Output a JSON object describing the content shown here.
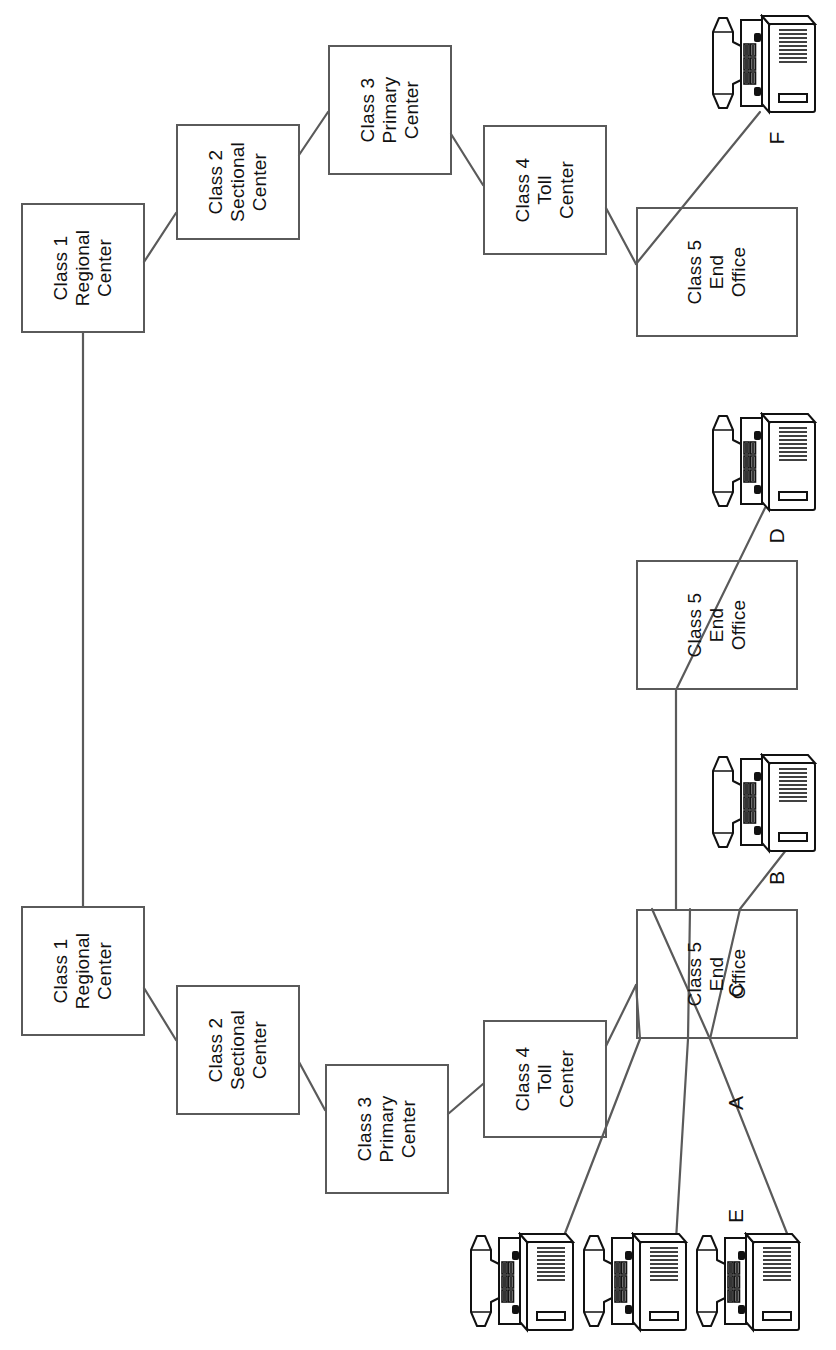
{
  "diagram": {
    "orientation_degrees": -90,
    "nodes": [
      {
        "id": "rc-top",
        "label": "Class 1\nRegional Center",
        "line1": "Class 1",
        "line2": "Regional",
        "line3": "Center",
        "x": 21,
        "y": 203,
        "w": 124,
        "h": 130
      },
      {
        "id": "sc-top",
        "label": "Class 2\nSectional Center",
        "line1": "Class 2",
        "line2": "Sectional",
        "line3": "Center",
        "x": 176,
        "y": 124,
        "w": 124,
        "h": 116
      },
      {
        "id": "pc-top",
        "label": "Class 3\nPrimary Center",
        "line1": "Class 3",
        "line2": "Primary",
        "line3": "Center",
        "x": 328,
        "y": 45,
        "w": 124,
        "h": 130
      },
      {
        "id": "tc-top",
        "label": "Class 4\nToll Center",
        "line1": "Class 4",
        "line2": "Toll",
        "line3": "Center",
        "x": 483,
        "y": 125,
        "w": 124,
        "h": 130
      },
      {
        "id": "eo-top",
        "label": "Class 5\nEnd Office",
        "line1": "Class 5",
        "line2": "End",
        "line3": "Office",
        "x": 636,
        "y": 207,
        "w": 162,
        "h": 130
      },
      {
        "id": "eo-mid",
        "label": "Class 5\nEnd Office",
        "line1": "Class 5",
        "line2": "End",
        "line3": "Office",
        "x": 636,
        "y": 560,
        "w": 162,
        "h": 130
      },
      {
        "id": "eo-bot",
        "label": "Class 5\nEnd Office",
        "line1": "Class 5",
        "line2": "End",
        "line3": "Office",
        "x": 636,
        "y": 909,
        "w": 162,
        "h": 130
      },
      {
        "id": "rc-bot",
        "label": "Class 1\nRegional Center",
        "line1": "Class 1",
        "line2": "Regional",
        "line3": "Center",
        "x": 21,
        "y": 906,
        "w": 124,
        "h": 130
      },
      {
        "id": "sc-bot",
        "label": "Class 2\nSectional Center",
        "line1": "Class 2",
        "line2": "Sectional",
        "line3": "Center",
        "x": 176,
        "y": 985,
        "w": 124,
        "h": 130
      },
      {
        "id": "pc-bot",
        "label": "Class 3\nPrimary Center",
        "line1": "Class 3",
        "line2": "Primary",
        "line3": "Center",
        "x": 325,
        "y": 1064,
        "w": 124,
        "h": 130
      },
      {
        "id": "tc-bot",
        "label": "Class 4\nToll Center",
        "line1": "Class 4",
        "line2": "Toll",
        "line3": "Center",
        "x": 483,
        "y": 1020,
        "w": 124,
        "h": 118
      }
    ],
    "phones": [
      {
        "id": "phone-f",
        "label": "F",
        "x": 712,
        "y": 14,
        "label_x": 770,
        "label_y": 130
      },
      {
        "id": "phone-d",
        "label": "D",
        "x": 712,
        "y": 412,
        "label_x": 770,
        "label_y": 528
      },
      {
        "id": "phone-b",
        "label": "B",
        "x": 712,
        "y": 753,
        "label_x": 770,
        "label_y": 869
      },
      {
        "id": "phone-e",
        "label": "E",
        "x": 470,
        "y": 1232,
        "label_x": 728,
        "label_y": 1210
      },
      {
        "id": "phone-a",
        "label": "A",
        "x": 583,
        "y": 1232,
        "label_x": 728,
        "label_y": 1210
      },
      {
        "id": "phone-c",
        "label": "C",
        "x": 696,
        "y": 1232,
        "label_x": 728,
        "label_y": 1210
      }
    ],
    "phone_labels": [
      {
        "id": "label-f",
        "text": "F",
        "x": 762,
        "y": 126
      },
      {
        "id": "label-d",
        "text": "D",
        "x": 762,
        "y": 524
      },
      {
        "id": "label-b",
        "text": "B",
        "x": 762,
        "y": 866
      },
      {
        "id": "label-e",
        "text": "E",
        "x": 721,
        "y": 1204
      },
      {
        "id": "label-a",
        "text": "A",
        "x": 721,
        "y": 1091
      },
      {
        "id": "label-c",
        "text": "C",
        "x": 721,
        "y": 978
      }
    ],
    "edges": [
      {
        "id": "edge-rc-top-rc-bot",
        "from": "rc-top",
        "to": "rc-bot",
        "points": "83,333 83,906"
      },
      {
        "id": "edge-rc-top-sc-top",
        "from": "rc-top",
        "to": "sc-top",
        "points": "144,262 176,213"
      },
      {
        "id": "edge-sc-top-pc-top",
        "from": "sc-top",
        "to": "pc-top",
        "points": "299,155 328,112"
      },
      {
        "id": "edge-pc-top-tc-top",
        "from": "pc-top",
        "to": "tc-top",
        "points": "451,134 483,185"
      },
      {
        "id": "edge-tc-top-eo-top",
        "from": "tc-top",
        "to": "eo-top",
        "points": "606,208 636,264"
      },
      {
        "id": "edge-eo-top-phone-f",
        "from": "eo-top",
        "to": "phone-f",
        "points": "636,264 760,112"
      },
      {
        "id": "edge-rc-bot-sc-bot",
        "from": "rc-bot",
        "to": "sc-bot",
        "points": "144,988 176,1040"
      },
      {
        "id": "edge-sc-bot-pc-bot",
        "from": "sc-bot",
        "to": "pc-bot",
        "points": "299,1062 325,1110"
      },
      {
        "id": "edge-pc-bot-tc-bot",
        "from": "pc-bot",
        "to": "tc-bot",
        "points": "448,1114 483,1084"
      },
      {
        "id": "edge-tc-bot-eo-bot",
        "from": "tc-bot",
        "to": "eo-bot",
        "points": "606,1046 636,985"
      },
      {
        "id": "edge-eo-bot-phone-e",
        "from": "eo-bot",
        "to": "phone-e",
        "points": "636,985 640,1039 562,1241"
      },
      {
        "id": "edge-eo-bot-phone-a",
        "from": "eo-bot",
        "to": "phone-a",
        "points": "690,909 688,1039 676,1240"
      },
      {
        "id": "edge-eo-bot-phone-c",
        "from": "eo-bot",
        "to": "phone-c",
        "points": "652,909 710,1039 790,1241"
      },
      {
        "id": "edge-eo-bot-phone-b",
        "from": "eo-bot",
        "to": "phone-b",
        "points": "710,1039 740,909 790,845"
      },
      {
        "id": "edge-eo-mid-phone-d",
        "from": "eo-mid",
        "to": "phone-d",
        "points": "676,909 676,690 765,508"
      }
    ]
  },
  "style": {
    "box_stroke": "#5a5a5a",
    "edge_stroke": "#5a5a5a",
    "text_color": "#111111",
    "background": "#ffffff",
    "phone_dark": "#111111",
    "phone_fill": "#ffffff"
  }
}
